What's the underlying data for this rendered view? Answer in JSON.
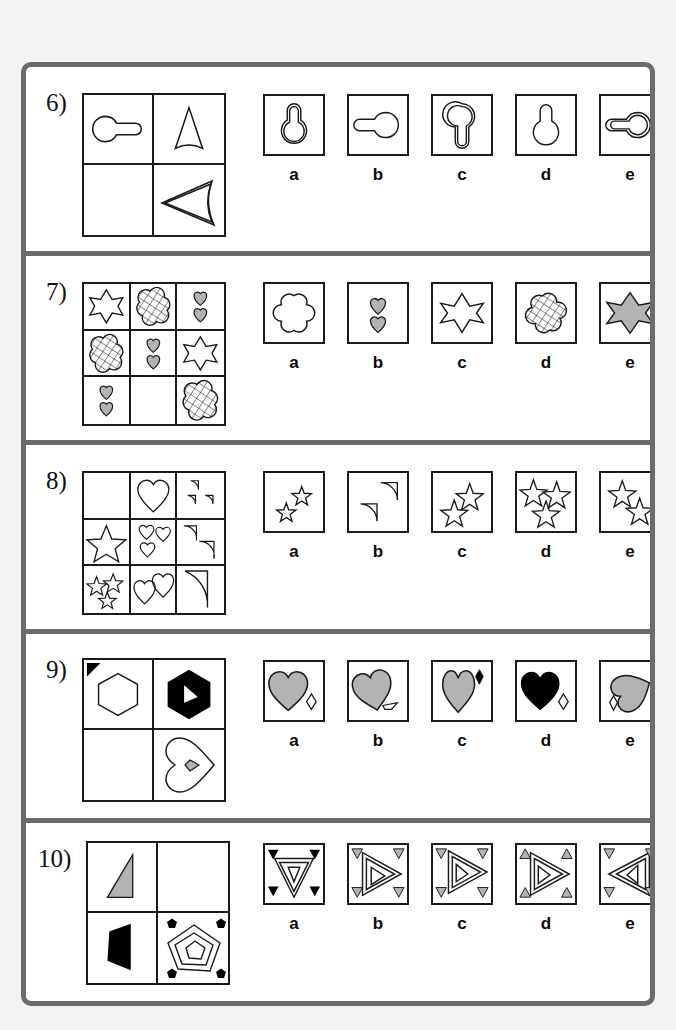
{
  "sheet": {
    "type": "non-verbal-reasoning-matrix-test",
    "ink_color": "#1a1a1a",
    "border_color": "#6b6b6b",
    "page_background": "#f2f2f1",
    "paper_background": "#ffffff",
    "fill_gray": "#b3b3b3",
    "fill_black": "#000000"
  },
  "questions": [
    {
      "id": "q6",
      "number": "6)",
      "matrix": {
        "rows": 2,
        "cols": 2,
        "cells": [
          {
            "pos": "r1c1",
            "shape": "keyhole-horizontal-outline",
            "fill": "none",
            "empty": false
          },
          {
            "pos": "r1c2",
            "shape": "curved-triangle-up-outline",
            "fill": "none",
            "empty": false
          },
          {
            "pos": "r2c1",
            "shape": "blank",
            "fill": "none",
            "empty": true
          },
          {
            "pos": "r2c2",
            "shape": "curved-triangle-left-double-outline",
            "fill": "none",
            "empty": false
          }
        ]
      },
      "options": [
        {
          "label": "a",
          "shape": "keyhole-vertical-double-outline",
          "fill": "none"
        },
        {
          "label": "b",
          "shape": "keyhole-horizontal-single-outline",
          "fill": "none"
        },
        {
          "label": "c",
          "shape": "keyhole-inverted-double-outline",
          "fill": "none"
        },
        {
          "label": "d",
          "shape": "keyhole-vertical-single-outline",
          "fill": "none"
        },
        {
          "label": "e",
          "shape": "keyhole-horizontal-double-outline",
          "fill": "none"
        }
      ]
    },
    {
      "id": "q7",
      "number": "7)",
      "matrix": {
        "rows": 3,
        "cols": 3,
        "cells": [
          {
            "pos": "r1c1",
            "shape": "six-point-star-outline",
            "fill": "none",
            "empty": false
          },
          {
            "pos": "r1c2",
            "shape": "quatrefoil-hatched",
            "fill": "hatch",
            "empty": false
          },
          {
            "pos": "r1c3",
            "shape": "two-small-hearts-gray",
            "fill": "gray",
            "empty": false
          },
          {
            "pos": "r2c1",
            "shape": "quatrefoil-hatched",
            "fill": "hatch",
            "empty": false
          },
          {
            "pos": "r2c2",
            "shape": "two-small-hearts-gray",
            "fill": "gray",
            "empty": false
          },
          {
            "pos": "r2c3",
            "shape": "six-point-star-outline",
            "fill": "none",
            "empty": false
          },
          {
            "pos": "r3c1",
            "shape": "two-small-hearts-gray",
            "fill": "gray",
            "empty": false
          },
          {
            "pos": "r3c2",
            "shape": "blank",
            "fill": "none",
            "empty": true
          },
          {
            "pos": "r3c3",
            "shape": "quatrefoil-hatched",
            "fill": "hatch",
            "empty": false
          }
        ]
      },
      "options": [
        {
          "label": "a",
          "shape": "quatrefoil-outline",
          "fill": "none"
        },
        {
          "label": "b",
          "shape": "two-small-hearts-gray",
          "fill": "gray"
        },
        {
          "label": "c",
          "shape": "six-point-star-outline",
          "fill": "none"
        },
        {
          "label": "d",
          "shape": "quatrefoil-hatched",
          "fill": "hatch"
        },
        {
          "label": "e",
          "shape": "six-point-star-gray",
          "fill": "gray"
        }
      ]
    },
    {
      "id": "q8",
      "number": "8)",
      "matrix": {
        "rows": 3,
        "cols": 3,
        "cells": [
          {
            "pos": "r1c1",
            "shape": "blank",
            "fill": "none",
            "empty": true
          },
          {
            "pos": "r1c2",
            "shape": "one-large-heart-outline",
            "fill": "none",
            "empty": false
          },
          {
            "pos": "r1c3",
            "shape": "three-small-quarter-circles-outline",
            "fill": "none",
            "empty": false
          },
          {
            "pos": "r2c1",
            "shape": "one-large-star-outline",
            "fill": "none",
            "empty": false
          },
          {
            "pos": "r2c2",
            "shape": "three-small-hearts-outline",
            "fill": "none",
            "empty": false
          },
          {
            "pos": "r2c3",
            "shape": "two-medium-quarter-circles-outline",
            "fill": "none",
            "empty": false
          },
          {
            "pos": "r3c1",
            "shape": "three-small-stars-outline",
            "fill": "none",
            "empty": false
          },
          {
            "pos": "r3c2",
            "shape": "two-medium-hearts-outline",
            "fill": "none",
            "empty": false
          },
          {
            "pos": "r3c3",
            "shape": "one-large-quarter-circle-outline",
            "fill": "none",
            "empty": false
          }
        ]
      },
      "options": [
        {
          "label": "a",
          "shape": "two-tiny-stars-outline",
          "fill": "none"
        },
        {
          "label": "b",
          "shape": "two-quarter-circles-outline",
          "fill": "none"
        },
        {
          "label": "c",
          "shape": "two-medium-stars-outline",
          "fill": "none"
        },
        {
          "label": "d",
          "shape": "three-large-stars-outline",
          "fill": "none"
        },
        {
          "label": "e",
          "shape": "two-large-stars-outline",
          "fill": "none"
        }
      ]
    },
    {
      "id": "q9",
      "number": "9)",
      "matrix": {
        "rows": 2,
        "cols": 2,
        "cells": [
          {
            "pos": "r1c1",
            "shape": "hexagon-outline-with-corner-marker",
            "fill": "none",
            "empty": false
          },
          {
            "pos": "r1c2",
            "shape": "hexagon-black-with-white-notch",
            "fill": "black",
            "empty": false
          },
          {
            "pos": "r2c1",
            "shape": "blank",
            "fill": "none",
            "empty": true
          },
          {
            "pos": "r2c2",
            "shape": "heart-rotated-outline-with-gray-kite",
            "fill": "none",
            "empty": false
          }
        ]
      },
      "options": [
        {
          "label": "a",
          "shape": "heart-gray-upright-with-outline-kite-right",
          "fill": "gray"
        },
        {
          "label": "b",
          "shape": "heart-gray-tilted-with-outline-kite-lower-right",
          "fill": "gray"
        },
        {
          "label": "c",
          "shape": "heart-gray-narrow-with-black-kite-upper-right",
          "fill": "gray"
        },
        {
          "label": "d",
          "shape": "heart-black-with-outline-kite-right",
          "fill": "black"
        },
        {
          "label": "e",
          "shape": "heart-gray-rotated-with-outline-kite-left",
          "fill": "gray"
        }
      ]
    },
    {
      "id": "q10",
      "number": "10)",
      "matrix": {
        "rows": 2,
        "cols": 2,
        "cells": [
          {
            "pos": "r1c1",
            "shape": "right-triangle-gray",
            "fill": "gray",
            "empty": false
          },
          {
            "pos": "r1c2",
            "shape": "blank",
            "fill": "none",
            "empty": true
          },
          {
            "pos": "r2c1",
            "shape": "quadrilateral-black",
            "fill": "black",
            "empty": false
          },
          {
            "pos": "r2c2",
            "shape": "nested-pentagons-with-four-black-pentagon-corners",
            "fill": "none",
            "empty": false
          }
        ]
      },
      "options": [
        {
          "label": "a",
          "shape": "nested-triangles-down-with-four-black-down-triangles",
          "fill": "none"
        },
        {
          "label": "b",
          "shape": "nested-triangles-right-with-four-gray-down-triangles",
          "fill": "none"
        },
        {
          "label": "c",
          "shape": "nested-triangles-right-with-four-gray-down-triangles-alt",
          "fill": "none"
        },
        {
          "label": "d",
          "shape": "nested-triangles-right-with-four-gray-up-triangles",
          "fill": "none"
        },
        {
          "label": "e",
          "shape": "nested-triangles-left-with-four-gray-down-triangles",
          "fill": "none"
        }
      ]
    }
  ]
}
